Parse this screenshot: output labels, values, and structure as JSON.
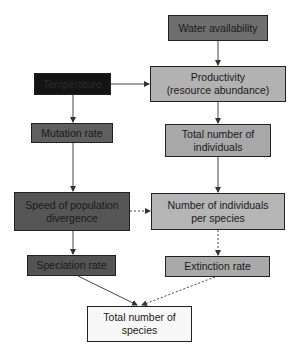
{
  "diagram": {
    "nodes": {
      "water": "Water availability",
      "temperature": "Temperature",
      "productivity_line1": "Productivity",
      "productivity_line2": "(resource abundance)",
      "mutation": "Mutation rate",
      "total_individuals_line1": "Total number of",
      "total_individuals_line2": "individuals",
      "speed_line1": "Speed of population",
      "speed_line2": "divergence",
      "per_species_line1": "Number of individuals",
      "per_species_line2": "per species",
      "speciation": "Speciation rate",
      "extinction": "Extinction rate",
      "total_species_line1": "Total number of",
      "total_species_line2": "species"
    },
    "edges": [
      {
        "from": "water",
        "to": "productivity",
        "style": "solid"
      },
      {
        "from": "temperature",
        "to": "productivity",
        "style": "solid"
      },
      {
        "from": "temperature",
        "to": "mutation",
        "style": "solid"
      },
      {
        "from": "productivity",
        "to": "total_individuals",
        "style": "solid"
      },
      {
        "from": "mutation",
        "to": "speed",
        "style": "solid"
      },
      {
        "from": "total_individuals",
        "to": "per_species",
        "style": "solid"
      },
      {
        "from": "speed",
        "to": "per_species",
        "style": "dotted"
      },
      {
        "from": "speed",
        "to": "speciation",
        "style": "solid"
      },
      {
        "from": "per_species",
        "to": "extinction",
        "style": "dotted"
      },
      {
        "from": "speciation",
        "to": "total_species",
        "style": "solid"
      },
      {
        "from": "extinction",
        "to": "total_species",
        "style": "dotted"
      }
    ]
  }
}
